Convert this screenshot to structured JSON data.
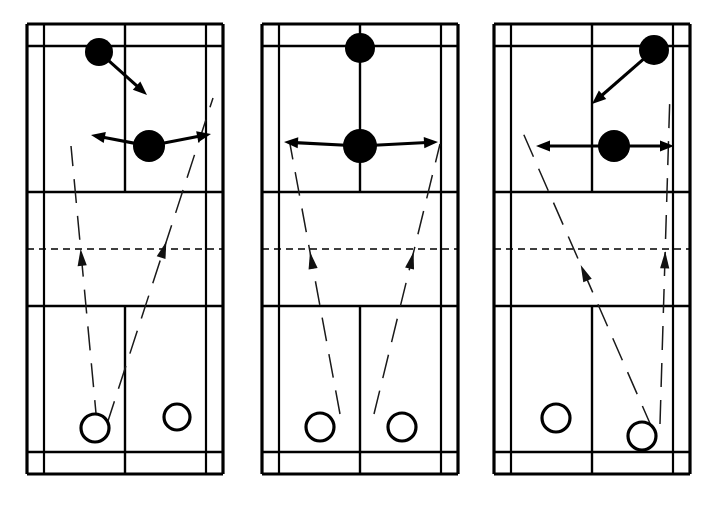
{
  "figure": {
    "panel_count": 3,
    "background_color": "#ffffff",
    "line_color": "#000000",
    "trajectory_color": "#1a1a1a"
  },
  "legend": {
    "dark_marker_label": "attacking player (filled circle)",
    "open_marker_label": "defending player (open circle)",
    "solid_arrow_label": "player movement direction",
    "dashed_arrow_label": "shuttle trajectory",
    "dashed_midline_label": "net"
  },
  "court_geometry": {
    "outer_left": 0,
    "outer_right": 196,
    "outer_top": 0,
    "outer_bottom": 450,
    "singles_side_left": 17,
    "singles_side_right": 179,
    "back_doubles_top": 22,
    "back_doubles_bottom": 428,
    "front_service_top": 168,
    "front_service_bottom": 282,
    "net_y": 225,
    "center_x": 98
  },
  "panels": [
    {
      "id": "panel-1",
      "name": "Attack from rear-left with cross-court returns",
      "dark_players": [
        {
          "name": "rear-attacker",
          "x": 72,
          "y": 28,
          "r": 14,
          "arrows": [
            {
              "dir": "down-right",
              "dx": 48,
              "dy": 43
            }
          ]
        },
        {
          "name": "front-attacker",
          "x": 122,
          "y": 122,
          "r": 16,
          "arrows": [
            {
              "dir": "left-up",
              "dx": -58,
              "dy": -11
            },
            {
              "dir": "right-up",
              "dx": 62,
              "dy": -12
            }
          ]
        }
      ],
      "open_players": [
        {
          "name": "defender-left",
          "x": 68,
          "y": 404,
          "r": 14
        },
        {
          "name": "defender-right",
          "x": 150,
          "y": 393,
          "r": 13
        }
      ],
      "trajectories": [
        {
          "name": "shuttle-left-lift",
          "points": [
            [
              70,
              400
            ],
            [
              44,
              122
            ]
          ],
          "arrow_at": 0.63
        },
        {
          "name": "shuttle-right-lift",
          "points": [
            [
              80,
              400
            ],
            [
              186,
              74
            ]
          ],
          "arrow_at": 0.56
        }
      ]
    },
    {
      "id": "panel-2",
      "name": "Attack from centre with symmetric lifts",
      "dark_players": [
        {
          "name": "rear-attacker",
          "x": 98,
          "y": 24,
          "r": 15,
          "arrows": []
        },
        {
          "name": "front-attacker",
          "x": 98,
          "y": 122,
          "r": 17,
          "arrows": [
            {
              "dir": "left",
              "dx": -76,
              "dy": -4
            },
            {
              "dir": "right",
              "dx": 78,
              "dy": -4
            }
          ]
        }
      ],
      "open_players": [
        {
          "name": "defender-left",
          "x": 58,
          "y": 403,
          "r": 14
        },
        {
          "name": "defender-right",
          "x": 140,
          "y": 403,
          "r": 14
        }
      ],
      "trajectories": [
        {
          "name": "shuttle-left-lift",
          "points": [
            [
              78,
              390
            ],
            [
              28,
              120
            ]
          ],
          "arrow_at": 0.6
        },
        {
          "name": "shuttle-right-lift",
          "points": [
            [
              112,
              390
            ],
            [
              178,
              120
            ]
          ],
          "arrow_at": 0.6
        }
      ]
    },
    {
      "id": "panel-3",
      "name": "Attack from rear-right with straight and cross lifts",
      "dark_players": [
        {
          "name": "rear-attacker",
          "x": 160,
          "y": 26,
          "r": 15,
          "arrows": [
            {
              "dir": "down-left",
              "dx": -62,
              "dy": 54
            }
          ]
        },
        {
          "name": "front-attacker",
          "x": 120,
          "y": 122,
          "r": 16,
          "arrows": [
            {
              "dir": "left",
              "dx": -78,
              "dy": 0
            },
            {
              "dir": "right",
              "dx": 60,
              "dy": 0
            }
          ]
        }
      ],
      "open_players": [
        {
          "name": "defender-left",
          "x": 62,
          "y": 394,
          "r": 14
        },
        {
          "name": "defender-right",
          "x": 148,
          "y": 412,
          "r": 14
        }
      ],
      "trajectories": [
        {
          "name": "shuttle-cross-lift",
          "points": [
            [
              158,
              404
            ],
            [
              26,
              102
            ]
          ],
          "arrow_at": 0.54
        },
        {
          "name": "shuttle-straight-lift",
          "points": [
            [
              166,
              400
            ],
            [
              176,
              68
            ]
          ],
          "arrow_at": 0.52
        }
      ]
    }
  ]
}
